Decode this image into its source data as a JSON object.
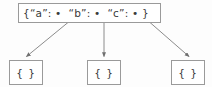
{
  "diagram": {
    "type": "json-object-reference-diagram",
    "background_color": "#fdfdfd",
    "stroke_color": "#8c8c8c",
    "text_color": "#3a3a3a",
    "root": {
      "name": "root-json-object",
      "text": "{“a”: •  “b”: •  “c”: • }",
      "keys": [
        "a",
        "b",
        "c"
      ]
    },
    "leaves": [
      {
        "name": "leaf-object-a",
        "text": "{ }",
        "key": "a"
      },
      {
        "name": "leaf-object-b",
        "text": "{ }",
        "key": "b"
      },
      {
        "name": "leaf-object-c",
        "text": "{ }",
        "key": "c"
      }
    ],
    "edges": [
      {
        "name": "edge-a",
        "from_key": "a",
        "direction": "down-left"
      },
      {
        "name": "edge-b",
        "from_key": "b",
        "direction": "down"
      },
      {
        "name": "edge-c",
        "from_key": "c",
        "direction": "down-right"
      }
    ]
  }
}
